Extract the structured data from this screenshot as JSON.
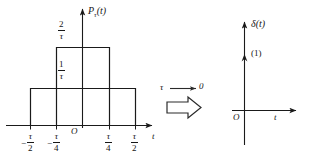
{
  "figure": {
    "title_left": "P_tau(t)",
    "title_right": "delta(t)"
  },
  "left_plot": {
    "y_axis_label": "P",
    "y_axis_label_sub": "τ",
    "y_axis_label_arg": "(t)",
    "x_axis_label": "t",
    "origin_label": "O",
    "y_ticks": [
      {
        "num": "2",
        "den": "τ",
        "value": "2/τ"
      },
      {
        "num": "1",
        "den": "τ",
        "value": "1/τ"
      }
    ],
    "x_ticks": [
      {
        "sign": "−",
        "num": "τ",
        "den": "2",
        "value": "-τ/2"
      },
      {
        "sign": "−",
        "num": "τ",
        "den": "4",
        "value": "-τ/4"
      },
      {
        "sign": "",
        "num": "τ",
        "den": "4",
        "value": "τ/4"
      },
      {
        "sign": "",
        "num": "τ",
        "den": "2",
        "value": "τ/2"
      }
    ],
    "pulses": [
      {
        "name": "outer-pulse",
        "from": "-τ/2",
        "to": "τ/2",
        "height": "1/τ"
      },
      {
        "name": "inner-pulse",
        "from": "-τ/4",
        "to": "τ/4",
        "height": "2/τ"
      }
    ]
  },
  "limit_annotation": {
    "variable": "τ",
    "arrow": "⟶",
    "limit_value": "0",
    "expression": "τ ⟶ 0"
  },
  "right_plot": {
    "y_axis_label": "δ",
    "y_axis_label_arg": "(t)",
    "x_axis_label": "t",
    "origin_label": "O",
    "impulse_weight": "(1)"
  },
  "colors": {
    "ink": "#161616",
    "line": "#1a1a1a",
    "background": "#ffffff"
  }
}
